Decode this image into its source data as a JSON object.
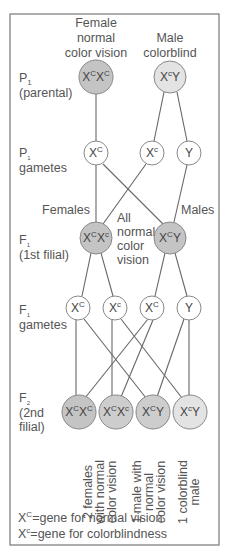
{
  "colors": {
    "frame": "#777777",
    "line": "#666666",
    "filled_circle": "#c4c4c4",
    "light_circle": "#e3e3e3",
    "open_circle": "#ffffff",
    "text": "#555555"
  },
  "rows": {
    "p1": {
      "label_main": "P",
      "label_sub": "1",
      "label_desc": "(parental)"
    },
    "p1_gametes": {
      "label_main": "P",
      "label_sub": "1",
      "label_desc": "gametes"
    },
    "f1": {
      "label_main": "F",
      "label_sub": "1",
      "label_desc": "(1st filial)"
    },
    "f1_gametes": {
      "label_main": "F",
      "label_sub": "1",
      "label_desc": "gametes"
    },
    "f2": {
      "label_main": "F",
      "label_sub": "2",
      "label_desc_1": "(2nd",
      "label_desc_2": "filial)"
    }
  },
  "parents": {
    "female": {
      "caption": [
        "Female",
        "normal",
        "color vision"
      ],
      "base1": "X",
      "sup1": "C",
      "base2": "X",
      "sup2": "C"
    },
    "male": {
      "caption": [
        "Male",
        "colorblind"
      ],
      "base1": "X",
      "sup1": "c",
      "base2": "Y",
      "sup2": ""
    }
  },
  "p1_gametes": [
    {
      "base": "X",
      "sup": "C"
    },
    {
      "base": "X",
      "sup": "c"
    },
    {
      "base": "Y",
      "sup": ""
    }
  ],
  "f1": {
    "females_label": "Females",
    "males_label": "Males",
    "note": [
      "All",
      "normal",
      "color",
      "vision"
    ],
    "female": {
      "base1": "X",
      "sup1": "C",
      "base2": "X",
      "sup2": "c"
    },
    "male": {
      "base1": "X",
      "sup1": "C",
      "base2": "Y",
      "sup2": ""
    }
  },
  "f1_gametes": [
    {
      "base": "X",
      "sup": "C"
    },
    {
      "base": "X",
      "sup": "c"
    },
    {
      "base": "X",
      "sup": "C"
    },
    {
      "base": "Y",
      "sup": ""
    }
  ],
  "f2": [
    {
      "base1": "X",
      "sup1": "C",
      "base2": "X",
      "sup2": "C"
    },
    {
      "base1": "X",
      "sup1": "C",
      "base2": "X",
      "sup2": "c"
    },
    {
      "base1": "X",
      "sup1": "C",
      "base2": "Y",
      "sup2": ""
    },
    {
      "base1": "X",
      "sup1": "c",
      "base2": "Y",
      "sup2": ""
    }
  ],
  "f2_captions": [
    [
      "2 females",
      "with normal",
      "color vision"
    ],
    [
      "1 male with",
      "normal",
      "color vision"
    ],
    [
      "1 colorblind",
      "male"
    ]
  ],
  "legend": [
    {
      "base": "X",
      "sup": "C",
      "text": "=gene for normal vision"
    },
    {
      "base": "X",
      "sup": "c",
      "text": "=gene for colorblindness"
    }
  ]
}
